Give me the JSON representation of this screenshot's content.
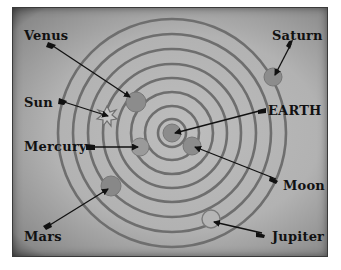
{
  "diagram": {
    "type": "geocentric-model",
    "center_label": "EARTH",
    "labels": {
      "venus": "Venus",
      "sun": "Sun",
      "mercury": "Mercury",
      "mars": "Mars",
      "saturn": "Saturn",
      "earth": "EARTH",
      "moon": "Moon",
      "jupiter": "Jupiter"
    },
    "colors": {
      "background": "#b7b7b7",
      "frame_border": "#3a3a3a",
      "orbit": "#6e6e6e",
      "planet": "#8c8c8c",
      "arrow": "#111111"
    }
  }
}
